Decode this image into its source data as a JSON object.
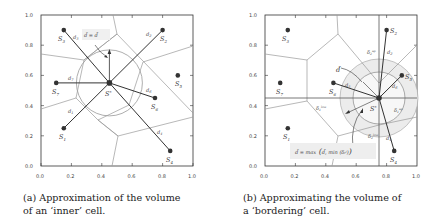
{
  "figure": {
    "panels": [
      {
        "id": "a",
        "caption": "(a) Approximation of the volume of an ‘inner’ cell.",
        "caption_line1": "(a) Approximation of the volume",
        "caption_line2": "of an ‘inner’ cell.",
        "x_ticks": [
          "0.0",
          "0.2",
          "0.4",
          "0.6",
          "0.8",
          "1.0"
        ],
        "y_ticks": [
          "0.0",
          "0.2",
          "0.4",
          "0.6",
          "0.8",
          "1.0"
        ],
        "center_label": "S*",
        "annotation": "d̃ = d̄",
        "sites": [
          {
            "label": "S1",
            "x": 0.15,
            "y": 0.25
          },
          {
            "label": "S2",
            "x": 0.8,
            "y": 0.9
          },
          {
            "label": "S3",
            "x": 0.15,
            "y": 0.9
          },
          {
            "label": "S4",
            "x": 0.85,
            "y": 0.1
          },
          {
            "label": "S5",
            "x": 0.9,
            "y": 0.6
          },
          {
            "label": "S6",
            "x": 0.75,
            "y": 0.45
          },
          {
            "label": "S7",
            "x": 0.1,
            "y": 0.55
          }
        ],
        "center": {
          "x": 0.45,
          "y": 0.55
        },
        "distances": [
          "d1",
          "d2",
          "d3",
          "d4",
          "d6",
          "d7"
        ]
      },
      {
        "id": "b",
        "caption": "(b) Approximating the volume of a ‘bordering’ cell.",
        "caption_line1": "(b) Approximating the volume of",
        "caption_line2": "a ‘bordering’ cell.",
        "x_ticks": [
          "0.0",
          "0.2",
          "0.4",
          "0.6",
          "0.8",
          "1.0"
        ],
        "y_ticks": [
          "0.0",
          "0.2",
          "0.4",
          "0.6",
          "0.8",
          "1.0"
        ],
        "center_label": "S*",
        "annotation_dbar": "d̄",
        "formula": "d̃ = max ( d̄, min (δᵢʲ) )",
        "formula_parts": {
          "lhs": "d̃ = max",
          "arg1": "d̄,",
          "min": "min",
          "sub": "i∈ℓ,h",
          "delta": "(δᵢʲ)"
        },
        "deltas": [
          "δ₂ᵘᵖ",
          "δ₁ˡᵒʷ",
          "δ₁ᵘᵖ",
          "δ₂ˡᵒʷ"
        ],
        "sites": [
          {
            "label": "S1",
            "x": 0.15,
            "y": 0.25
          },
          {
            "label": "S2",
            "x": 0.8,
            "y": 0.9
          },
          {
            "label": "S3",
            "x": 0.15,
            "y": 0.9
          },
          {
            "label": "S4",
            "x": 0.85,
            "y": 0.1
          },
          {
            "label": "S5",
            "x": 0.9,
            "y": 0.6
          },
          {
            "label": "S6",
            "x": 0.45,
            "y": 0.55
          },
          {
            "label": "S7",
            "x": 0.1,
            "y": 0.55
          }
        ],
        "center": {
          "x": 0.75,
          "y": 0.45
        },
        "distances": [
          "d2",
          "d4",
          "d5",
          "d6"
        ]
      }
    ]
  }
}
